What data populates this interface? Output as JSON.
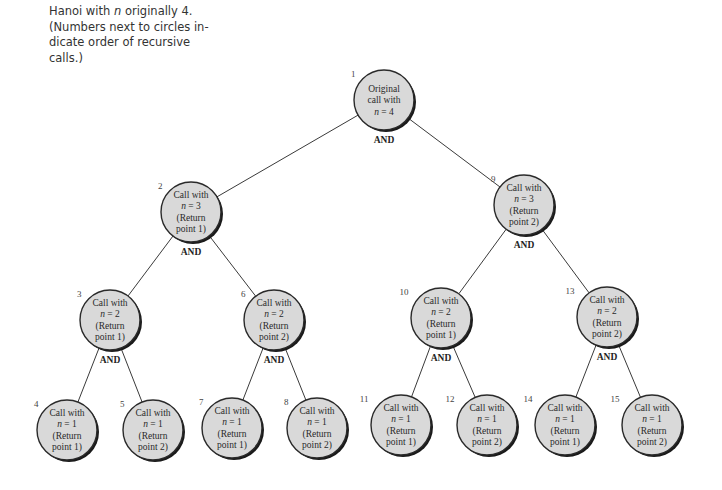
{
  "caption": {
    "line1_prefix": "Hanoi with ",
    "line1_var": "n",
    "line1_suffix": " originally 4.",
    "line2": "(Numbers next to circles in-",
    "line3": "dicate order of recursive",
    "line4": "calls.)"
  },
  "and_label": "AND",
  "nodes": [
    {
      "order": "1",
      "cx": 384,
      "cy": 100,
      "lines": [
        "Original",
        "call with",
        "n = 4"
      ],
      "and": true,
      "parent": null
    },
    {
      "order": "2",
      "cx": 191,
      "cy": 212,
      "lines": [
        "Call with",
        "n = 3",
        "(Return",
        "point 1)"
      ],
      "and": true,
      "parent": 0
    },
    {
      "order": "9",
      "cx": 524,
      "cy": 205,
      "lines": [
        "Call with",
        "n = 3",
        "(Return",
        "point 2)"
      ],
      "and": true,
      "parent": 0
    },
    {
      "order": "3",
      "cx": 110,
      "cy": 320,
      "lines": [
        "Call with",
        "n = 2",
        "(Return",
        "point 1)"
      ],
      "and": true,
      "parent": 1
    },
    {
      "order": "6",
      "cx": 274,
      "cy": 320,
      "lines": [
        "Call with",
        "n = 2",
        "(Return",
        "point 2)"
      ],
      "and": true,
      "parent": 1
    },
    {
      "order": "10",
      "cx": 441,
      "cy": 318,
      "lines": [
        "Call with",
        "n = 2",
        "(Return",
        "point 1)"
      ],
      "and": true,
      "parent": 2
    },
    {
      "order": "13",
      "cx": 607,
      "cy": 317,
      "lines": [
        "Call with",
        "n = 2",
        "(Return",
        "point 2)"
      ],
      "and": true,
      "parent": 2
    },
    {
      "order": "4",
      "cx": 67,
      "cy": 430,
      "lines": [
        "Call with",
        "n = 1",
        "(Return",
        "point 1)"
      ],
      "and": false,
      "parent": 3
    },
    {
      "order": "5",
      "cx": 153,
      "cy": 430,
      "lines": [
        "Call with",
        "n = 1",
        "(Return",
        "point 2)"
      ],
      "and": false,
      "parent": 3
    },
    {
      "order": "7",
      "cx": 232,
      "cy": 428,
      "lines": [
        "Call with",
        "n = 1",
        "(Return",
        "point 1)"
      ],
      "and": false,
      "parent": 4
    },
    {
      "order": "8",
      "cx": 317,
      "cy": 428,
      "lines": [
        "Call with",
        "n = 1",
        "(Return",
        "point 2)"
      ],
      "and": false,
      "parent": 4
    },
    {
      "order": "11",
      "cx": 401,
      "cy": 425,
      "lines": [
        "Call with",
        "n = 1",
        "(Return",
        "point 1)"
      ],
      "and": false,
      "parent": 5
    },
    {
      "order": "12",
      "cx": 487,
      "cy": 425,
      "lines": [
        "Call with",
        "n = 1",
        "(Return",
        "point 2)"
      ],
      "and": false,
      "parent": 5
    },
    {
      "order": "14",
      "cx": 565,
      "cy": 425,
      "lines": [
        "Call with",
        "n = 1",
        "(Return",
        "point 1)"
      ],
      "and": false,
      "parent": 6
    },
    {
      "order": "15",
      "cx": 652,
      "cy": 425,
      "lines": [
        "Call with",
        "n = 1",
        "(Return",
        "point 2)"
      ],
      "and": false,
      "parent": 6
    }
  ],
  "style": {
    "radius": 30,
    "fill": "#d9d9d9",
    "stroke": "#2a2a2a",
    "shadow": "#1a1a1a"
  }
}
